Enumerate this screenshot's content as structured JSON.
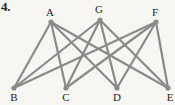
{
  "figure": {
    "problem_number": "4.",
    "type": "graph-diagram",
    "colors": {
      "background": "#f7f6f3",
      "edge": "#8a8a8a",
      "node": "#8a8a8a",
      "label": "#1f1f1f",
      "number": "#2b2b2b"
    },
    "edge_width": 2.2,
    "node_radius": 2.6
  },
  "nodes": [
    {
      "id": "A",
      "label": "A",
      "x": 51,
      "y": 22,
      "label_x": 50,
      "label_y": 7,
      "row": "top"
    },
    {
      "id": "G",
      "label": "G",
      "x": 100,
      "y": 20,
      "label_x": 99,
      "label_y": 4,
      "row": "top"
    },
    {
      "id": "F",
      "label": "F",
      "x": 156,
      "y": 22,
      "label_x": 155,
      "label_y": 7,
      "row": "top"
    },
    {
      "id": "B",
      "label": "B",
      "x": 14,
      "y": 88,
      "label_x": 14,
      "label_y": 92,
      "row": "bottom"
    },
    {
      "id": "C",
      "label": "C",
      "x": 66,
      "y": 88,
      "label_x": 66,
      "label_y": 92,
      "row": "bottom"
    },
    {
      "id": "D",
      "label": "D",
      "x": 117,
      "y": 88,
      "label_x": 117,
      "label_y": 92,
      "row": "bottom"
    },
    {
      "id": "E",
      "label": "E",
      "x": 168,
      "y": 88,
      "label_x": 170,
      "label_y": 92,
      "row": "bottom"
    }
  ],
  "edges": [
    {
      "from": "A",
      "to": "B"
    },
    {
      "from": "A",
      "to": "C"
    },
    {
      "from": "A",
      "to": "D"
    },
    {
      "from": "A",
      "to": "E"
    },
    {
      "from": "G",
      "to": "B"
    },
    {
      "from": "G",
      "to": "C"
    },
    {
      "from": "G",
      "to": "D"
    },
    {
      "from": "G",
      "to": "E"
    },
    {
      "from": "F",
      "to": "B"
    },
    {
      "from": "F",
      "to": "C"
    },
    {
      "from": "F",
      "to": "D"
    },
    {
      "from": "F",
      "to": "E"
    }
  ]
}
